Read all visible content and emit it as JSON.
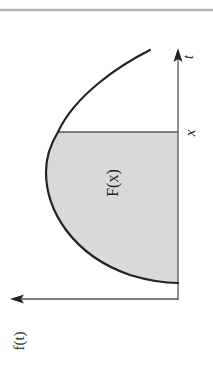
{
  "diagram": {
    "type": "area-under-curve",
    "orientation": "rotated 90° clockwise (horizontal axis drawn vertically)",
    "colors": {
      "stroke": "#222222",
      "axis": "#555555",
      "fill": "#d9d9d9",
      "border": "#b5b5b5",
      "background": "#ffffff"
    },
    "labels": {
      "y_axis": "f(t)",
      "x_axis": "t",
      "marker": "x",
      "region": "F(x)"
    }
  }
}
